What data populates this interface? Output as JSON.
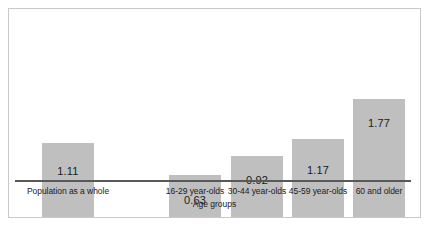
{
  "chart_data": {
    "type": "bar",
    "title": "",
    "xlabel": "Age groups",
    "ylabel": "",
    "grid": false,
    "legend": "none",
    "ylim": [
      0,
      2.0
    ],
    "categories": [
      "Population as a whole",
      "16-29 year-olds",
      "30-44 year-olds",
      "45-59 year-olds",
      "60 and older"
    ],
    "values": [
      1.11,
      0.63,
      0.92,
      1.17,
      1.77
    ],
    "value_labels": [
      "1.11",
      "0.63",
      "0.92",
      "1.17",
      "1.77"
    ],
    "bar_color": "#bfbfbf",
    "axis_color": "#595959",
    "frame_color": "#c9c9c9",
    "text_color": "#1a1a1a"
  }
}
